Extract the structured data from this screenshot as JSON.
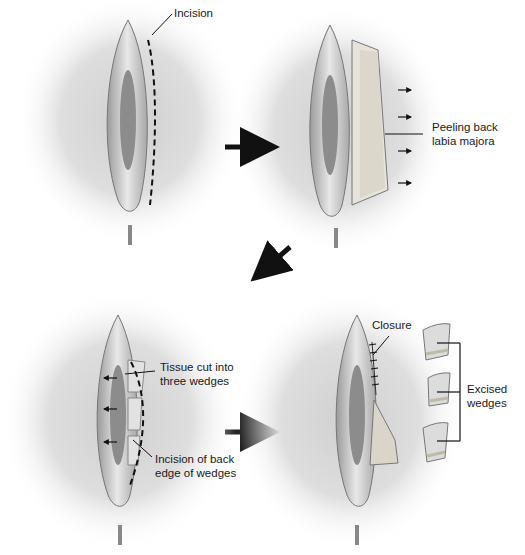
{
  "diagram": {
    "type": "surgical-procedure-illustration",
    "panels": [
      {
        "id": 1,
        "position": "top-left",
        "labels": [
          "Incision"
        ]
      },
      {
        "id": 2,
        "position": "top-right",
        "labels": [
          "Peeling back labia majora"
        ]
      },
      {
        "id": 3,
        "position": "bottom-left",
        "labels": [
          "Tissue cut into three wedges",
          "Incision of back edge of wedges"
        ]
      },
      {
        "id": 4,
        "position": "bottom-right",
        "labels": [
          "Closure",
          "Excised wedges"
        ]
      }
    ],
    "labels": {
      "incision": "Incision",
      "peeling_line1": "Peeling back",
      "peeling_line2": "labia majora",
      "tissue_line1": "Tissue cut into",
      "tissue_line2": "three wedges",
      "back_edge_line1": "Incision of back",
      "back_edge_line2": "edge of wedges",
      "closure": "Closure",
      "excised_line1": "Excised",
      "excised_line2": "wedges"
    },
    "arrows": [
      {
        "from": "panel-1",
        "to": "panel-2",
        "direction": "right"
      },
      {
        "from": "panel-2",
        "to": "panel-3",
        "direction": "down-left"
      },
      {
        "from": "panel-3",
        "to": "panel-4",
        "direction": "right"
      }
    ]
  }
}
